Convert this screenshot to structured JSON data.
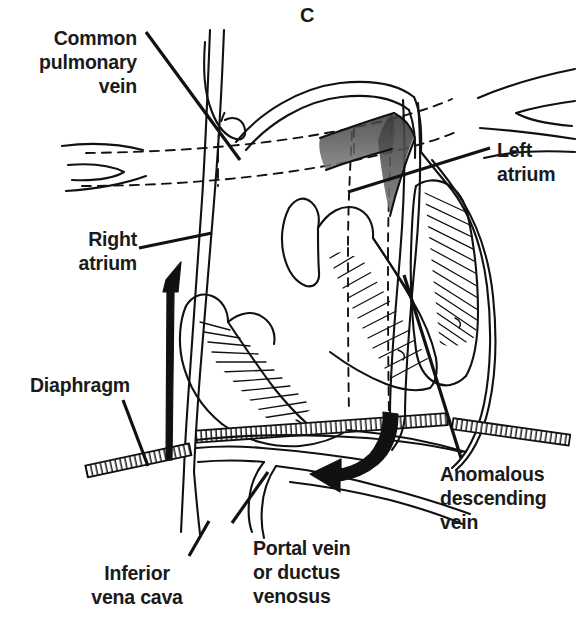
{
  "figure": {
    "panel_letter": "C",
    "style": "black-and-white-line-drawing"
  },
  "colors": {
    "ink": "#1a1a1a",
    "stroke": "#111111",
    "background": "#ffffff",
    "shading": "#555555"
  },
  "labels": {
    "common_pulmonary_vein": "Common\npulmonary\nvein",
    "right_atrium": "Right\natrium",
    "diaphragm": "Diaphragm",
    "inferior_vena_cava": "Inferior\nvena cava",
    "portal_vein": "Portal vein\nor ductus\nvenosus",
    "left_atrium": "Left\natrium",
    "anomalous_descending_vein": "Anomalous\ndescending\nvein"
  },
  "leader_lines": [
    {
      "name": "common-pulmonary-vein-leader",
      "x1": 146,
      "y1": 32,
      "x2": 240,
      "y2": 160
    },
    {
      "name": "right-atrium-leader",
      "x1": 139,
      "y1": 248,
      "x2": 212,
      "y2": 233
    },
    {
      "name": "diaphragm-leader",
      "x1": 123,
      "y1": 400,
      "x2": 148,
      "y2": 466
    },
    {
      "name": "inferior-vena-cava-leader",
      "x1": 189,
      "y1": 556,
      "x2": 209,
      "y2": 521
    },
    {
      "name": "portal-vein-leader",
      "x1": 232,
      "y1": 523,
      "x2": 268,
      "y2": 472
    },
    {
      "name": "left-atrium-leader",
      "x1": 490,
      "y1": 148,
      "x2": 348,
      "y2": 192
    },
    {
      "name": "anomalous-vein-leader",
      "x1": 461,
      "y1": 458,
      "x2": 404,
      "y2": 275
    }
  ],
  "flow_arrows": [
    {
      "name": "inferior-vena-cava-upward-arrow",
      "direction": "up",
      "meaning": "systemic venous return ascending in IVC"
    },
    {
      "name": "anomalous-vein-descending-arrow",
      "direction": "down-then-left",
      "meaning": "pulmonary venous blood descending below diaphragm"
    }
  ],
  "structures": [
    "common pulmonary vein confluence",
    "right pulmonary veins",
    "left pulmonary veins",
    "right atrium",
    "left atrium",
    "right ventricle",
    "left ventricle",
    "interventricular septum",
    "diaphragm",
    "inferior vena cava",
    "portal vein",
    "ductus venosus",
    "anomalous descending vein"
  ]
}
